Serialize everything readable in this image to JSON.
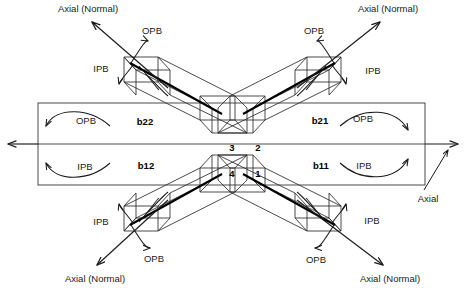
{
  "figure": {
    "kind": "tubular-x-joint-loading-diagram",
    "braces": [
      {
        "id": "b22",
        "label": "b22",
        "quadrant": "upper-left"
      },
      {
        "id": "b21",
        "label": "b21",
        "quadrant": "upper-right"
      },
      {
        "id": "b12",
        "label": "b12",
        "quadrant": "lower-left"
      },
      {
        "id": "b11",
        "label": "b11",
        "quadrant": "lower-right"
      }
    ],
    "hotspots": [
      {
        "id": "hs1",
        "label": "1",
        "position": "center-right-lower"
      },
      {
        "id": "hs2",
        "label": "2",
        "position": "center-right-upper"
      },
      {
        "id": "hs3",
        "label": "3",
        "position": "center-left-upper"
      },
      {
        "id": "hs4",
        "label": "4",
        "position": "center-left-lower"
      }
    ],
    "load_labels": {
      "axial_normal": "Axial (Normal)",
      "axial": "Axial",
      "ipb": "IPB",
      "opb": "OPB"
    },
    "annotations": [
      {
        "id": "axial-tl",
        "text": "Axial (Normal)",
        "x": 88,
        "y": 9,
        "anchor": "middle"
      },
      {
        "id": "axial-tr",
        "text": "Axial (Normal)",
        "x": 388,
        "y": 9,
        "anchor": "middle"
      },
      {
        "id": "axial-bl",
        "text": "Axial (Normal)",
        "x": 95,
        "y": 279,
        "anchor": "middle"
      },
      {
        "id": "axial-br",
        "text": "Axial (Normal)",
        "x": 390,
        "y": 279,
        "anchor": "middle"
      },
      {
        "id": "axial-r",
        "text": "Axial",
        "x": 428,
        "y": 199,
        "anchor": "middle"
      },
      {
        "id": "opb-tl",
        "text": "OPB",
        "x": 152,
        "y": 31,
        "anchor": "middle"
      },
      {
        "id": "opb-tr",
        "text": "OPB",
        "x": 314,
        "y": 31,
        "anchor": "middle"
      },
      {
        "id": "ipb-tl",
        "text": "IPB",
        "x": 101,
        "y": 69,
        "anchor": "middle"
      },
      {
        "id": "ipb-tr",
        "text": "IPB",
        "x": 373,
        "y": 71,
        "anchor": "middle"
      },
      {
        "id": "opb-chord-l",
        "text": "OPB",
        "x": 86,
        "y": 121,
        "anchor": "middle"
      },
      {
        "id": "opb-chord-r",
        "text": "OPB",
        "x": 363,
        "y": 119,
        "anchor": "middle"
      },
      {
        "id": "ipb-chord-l",
        "text": "IPB",
        "x": 85,
        "y": 167,
        "anchor": "middle"
      },
      {
        "id": "ipb-chord-r",
        "text": "IPB",
        "x": 364,
        "y": 166,
        "anchor": "middle"
      },
      {
        "id": "brace-b22",
        "text": "b22",
        "x": 145,
        "y": 122,
        "anchor": "middle"
      },
      {
        "id": "brace-b21",
        "text": "b21",
        "x": 320,
        "y": 121,
        "anchor": "middle"
      },
      {
        "id": "brace-b12",
        "text": "b12",
        "x": 146,
        "y": 166,
        "anchor": "middle"
      },
      {
        "id": "brace-b11",
        "text": "b11",
        "x": 321,
        "y": 166,
        "anchor": "middle"
      },
      {
        "id": "num-3",
        "text": "3",
        "x": 232,
        "y": 148,
        "anchor": "middle"
      },
      {
        "id": "num-2",
        "text": "2",
        "x": 258,
        "y": 148,
        "anchor": "middle"
      },
      {
        "id": "num-4",
        "text": "4",
        "x": 232,
        "y": 174,
        "anchor": "middle"
      },
      {
        "id": "num-1",
        "text": "1",
        "x": 258,
        "y": 174,
        "anchor": "middle"
      },
      {
        "id": "ipb-bl",
        "text": "IPB",
        "x": 101,
        "y": 222,
        "anchor": "middle"
      },
      {
        "id": "ipb-br",
        "text": "IPB",
        "x": 372,
        "y": 221,
        "anchor": "middle"
      },
      {
        "id": "opb-bl",
        "text": "OPB",
        "x": 154,
        "y": 259,
        "anchor": "middle"
      },
      {
        "id": "opb-br",
        "text": "OPB",
        "x": 316,
        "y": 260,
        "anchor": "middle"
      }
    ],
    "colors": {
      "background": "#ffffff",
      "line": "#2b2b2b",
      "line_heavy": "#000000",
      "text": "#1a1a1a"
    }
  }
}
